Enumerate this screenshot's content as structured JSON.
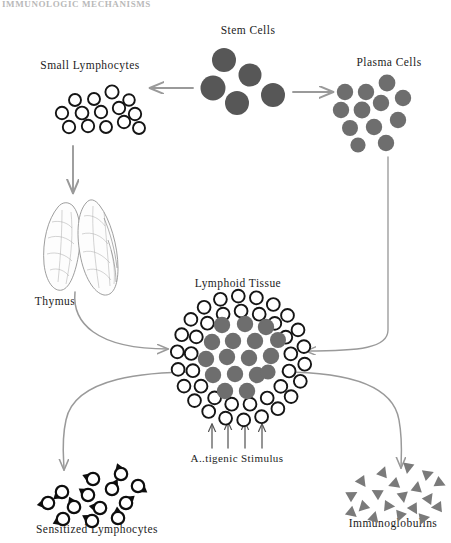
{
  "figure": {
    "type": "biological-flow-diagram",
    "background_color": "#ffffff",
    "top_cropped_text": "IMMUNOLOGIC MECHANISMS"
  },
  "palette": {
    "stem_cell_fill": "#575757",
    "plasma_cell_fill": "#6e6e6e",
    "lymphoid_core_fill": "#6e6e6e",
    "immunoglobulin_fill": "#7a7a7a",
    "open_circle_stroke": "#151515",
    "sensitized_stroke": "#0d0d0d",
    "arrow_color": "#9a9a9a",
    "stimulus_arrow_color": "#555555",
    "thymus_stroke": "#8c8c8c",
    "text_color": "#1c1c1c"
  },
  "labels": {
    "stem_cells": "Stem Cells",
    "small_lymphocytes": "Small Lymphocytes",
    "plasma_cells": "Plasma Cells",
    "thymus": "Thymus",
    "lymphoid_tissue": "Lymphoid Tissue",
    "antigenic_stimulus": "A..tigenic Stimulus",
    "antigenic_stimulus_full": "Antigenic Stimulus",
    "sensitized_lymphocytes": "Sensitized Lymphocytes",
    "immunoglobulins": "Immunoglobulins"
  },
  "label_positions": {
    "stem_cells": {
      "x": 248,
      "y": 34
    },
    "small_lymphocytes": {
      "x": 90,
      "y": 69
    },
    "plasma_cells": {
      "x": 389,
      "y": 66
    },
    "thymus": {
      "x": 55,
      "y": 305
    },
    "lymphoid_tissue": {
      "x": 238,
      "y": 287
    },
    "antigenic_stimulus": {
      "x": 237,
      "y": 462
    },
    "sensitized_lymphocytes": {
      "x": 97,
      "y": 533
    },
    "immunoglobulins": {
      "x": 393,
      "y": 527
    }
  },
  "chart_data": {
    "type": "diagram",
    "nodes": [
      {
        "id": "stem_cells",
        "label": "Stem Cells",
        "cell_style": "filled",
        "count": 5,
        "radius": 11.5,
        "color": "#575757"
      },
      {
        "id": "small_lymphocytes",
        "label": "Small Lymphocytes",
        "cell_style": "open",
        "count": 14,
        "radius": 6.2
      },
      {
        "id": "plasma_cells",
        "label": "Plasma Cells",
        "cell_style": "filled",
        "count": 12,
        "radius": 8.2,
        "color": "#6e6e6e"
      },
      {
        "id": "thymus",
        "label": "Thymus",
        "cell_style": "organ-outline",
        "count": 2
      },
      {
        "id": "lymphoid_tissue",
        "label": "Lymphoid Tissue",
        "cell_style": "mixed",
        "core_count": 17,
        "ring_count": 40
      },
      {
        "id": "sensitized_lymphocytes",
        "label": "Sensitized Lymphocytes",
        "cell_style": "teardrop",
        "count": 13
      },
      {
        "id": "immunoglobulins",
        "label": "Immunoglobulins",
        "cell_style": "triangle",
        "count": 19,
        "color": "#7a7a7a"
      }
    ],
    "edges": [
      {
        "from": "stem_cells",
        "to": "small_lymphocytes",
        "shape": "straight-left"
      },
      {
        "from": "stem_cells",
        "to": "plasma_cells",
        "shape": "straight-right"
      },
      {
        "from": "small_lymphocytes",
        "to": "thymus",
        "shape": "straight-down"
      },
      {
        "from": "thymus",
        "to": "lymphoid_tissue",
        "shape": "curve-down-right"
      },
      {
        "from": "plasma_cells",
        "to": "lymphoid_tissue",
        "shape": "curve-down-left"
      },
      {
        "from": "lymphoid_tissue",
        "to": "sensitized_lymphocytes",
        "shape": "curve-down-left"
      },
      {
        "from": "lymphoid_tissue",
        "to": "immunoglobulins",
        "shape": "curve-down-right"
      },
      {
        "from": "antigenic_stimulus",
        "to": "lymphoid_tissue",
        "shape": "four-arrows-up",
        "arrow_count": 4
      }
    ]
  },
  "cells": {
    "stem_cells": [
      {
        "x": 224,
        "y": 60,
        "r": 12
      },
      {
        "x": 213,
        "y": 88,
        "r": 12.5
      },
      {
        "x": 250,
        "y": 75,
        "r": 11.5
      },
      {
        "x": 237,
        "y": 103,
        "r": 12
      },
      {
        "x": 273,
        "y": 95,
        "r": 12
      }
    ],
    "small_lymphocytes": [
      {
        "x": 75,
        "y": 100,
        "r": 6
      },
      {
        "x": 94,
        "y": 99,
        "r": 6
      },
      {
        "x": 112,
        "y": 92,
        "r": 6.6
      },
      {
        "x": 129,
        "y": 100,
        "r": 5.8
      },
      {
        "x": 62,
        "y": 113,
        "r": 6.2
      },
      {
        "x": 82,
        "y": 113,
        "r": 6.4
      },
      {
        "x": 101,
        "y": 112,
        "r": 6.2
      },
      {
        "x": 119,
        "y": 108,
        "r": 6.2
      },
      {
        "x": 135,
        "y": 114,
        "r": 6.2
      },
      {
        "x": 69,
        "y": 127,
        "r": 6.2
      },
      {
        "x": 88,
        "y": 126,
        "r": 6.2
      },
      {
        "x": 106,
        "y": 127,
        "r": 6
      },
      {
        "x": 124,
        "y": 122,
        "r": 6.2
      },
      {
        "x": 139,
        "y": 128,
        "r": 6
      }
    ],
    "plasma_cells": [
      {
        "x": 345,
        "y": 92,
        "r": 8.2
      },
      {
        "x": 366,
        "y": 92,
        "r": 8.2
      },
      {
        "x": 387,
        "y": 83,
        "r": 8.4
      },
      {
        "x": 341,
        "y": 110,
        "r": 8.2
      },
      {
        "x": 362,
        "y": 110,
        "r": 8.4
      },
      {
        "x": 381,
        "y": 103,
        "r": 8.2
      },
      {
        "x": 403,
        "y": 98,
        "r": 8.2
      },
      {
        "x": 350,
        "y": 128,
        "r": 8
      },
      {
        "x": 374,
        "y": 127,
        "r": 8.2
      },
      {
        "x": 398,
        "y": 120,
        "r": 8.2
      },
      {
        "x": 386,
        "y": 143,
        "r": 8.2
      },
      {
        "x": 358,
        "y": 145,
        "r": 7.6
      }
    ],
    "lymphoid_core": [
      {
        "x": 222,
        "y": 325,
        "r": 8.2
      },
      {
        "x": 245,
        "y": 324,
        "r": 8.2
      },
      {
        "x": 266,
        "y": 327,
        "r": 8.2
      },
      {
        "x": 212,
        "y": 342,
        "r": 8.2
      },
      {
        "x": 233,
        "y": 341,
        "r": 8.2
      },
      {
        "x": 255,
        "y": 341,
        "r": 8.2
      },
      {
        "x": 206,
        "y": 359,
        "r": 8.2
      },
      {
        "x": 227,
        "y": 357,
        "r": 8.2
      },
      {
        "x": 249,
        "y": 358,
        "r": 8.2
      },
      {
        "x": 271,
        "y": 356,
        "r": 8.2
      },
      {
        "x": 213,
        "y": 375,
        "r": 8.2
      },
      {
        "x": 235,
        "y": 374,
        "r": 8.2
      },
      {
        "x": 257,
        "y": 375,
        "r": 8.2
      },
      {
        "x": 225,
        "y": 391,
        "r": 8.2
      },
      {
        "x": 247,
        "y": 391,
        "r": 8.2
      },
      {
        "x": 278,
        "y": 340,
        "r": 8
      },
      {
        "x": 268,
        "y": 372,
        "r": 7.6
      }
    ]
  },
  "accessibility": {
    "description": "Flow diagram showing stem cells differentiating into small lymphocytes and plasma cells; small lymphocytes pass through the thymus; both pathways converge on lymphoid tissue, which under antigenic stimulus produces sensitized lymphocytes and immunoglobulins."
  }
}
